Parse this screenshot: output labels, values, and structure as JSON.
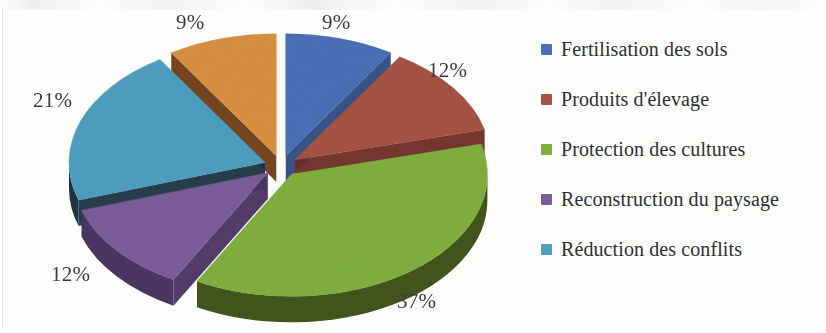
{
  "chart_data": {
    "type": "pie",
    "title": "",
    "subtitle": "",
    "xlabel": "",
    "ylabel": "",
    "style": "3d-exploded-pie",
    "legend_position": "right",
    "grid": false,
    "value_suffix": "%",
    "categories": [
      "Fertilisation des sols",
      "Produits d'élevage",
      "Protection des cultures",
      "Reconstruction du paysage",
      "Réduction des conflits",
      ""
    ],
    "values": [
      9,
      12,
      37,
      12,
      21,
      9
    ],
    "labels": [
      "9%",
      "12%",
      "37%",
      "12%",
      "21%",
      "9%"
    ],
    "colors": [
      "#4A6FB5",
      "#A65244",
      "#7FAF3E",
      "#7A5C99",
      "#4E9EBF",
      "#D79042"
    ],
    "slices": [
      {
        "label": "9%",
        "value": 9,
        "category": "Fertilisation des sols",
        "color": "#4A6FB5",
        "side_color": "#2F4C80"
      },
      {
        "label": "12%",
        "value": 12,
        "category": "Produits d'élevage",
        "color": "#A65244",
        "side_color": "#6E2F26"
      },
      {
        "label": "37%",
        "value": 37,
        "category": "Protection des cultures",
        "color": "#7FAF3E",
        "side_color": "#43541F"
      },
      {
        "label": "12%",
        "value": 12,
        "category": "Reconstruction du paysage",
        "color": "#7A5C99",
        "side_color": "#4B3463"
      },
      {
        "label": "21%",
        "value": 21,
        "category": "Réduction des conflits",
        "color": "#4E9EBF",
        "side_color": "#1E3642"
      },
      {
        "label": "9%",
        "value": 9,
        "category": "",
        "color": "#D79042",
        "side_color": "#6E3D18"
      }
    ]
  },
  "pct_labels": {
    "top_left": "9%",
    "top_right": "9%",
    "right": "12%",
    "bottom_right": "37%",
    "bottom_left": "12%",
    "left": "21%"
  },
  "legend": {
    "items": [
      {
        "label": "Fertilisation des sols",
        "color": "#4A6FB5"
      },
      {
        "label": "Produits d'élevage",
        "color": "#A65244"
      },
      {
        "label": "Protection des cultures",
        "color": "#7FAF3E"
      },
      {
        "label": "Reconstruction du paysage",
        "color": "#7A5C99"
      },
      {
        "label": "Réduction des conflits",
        "color": "#4E9EBF"
      }
    ]
  }
}
